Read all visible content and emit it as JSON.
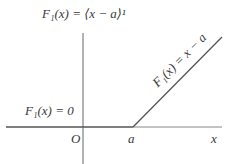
{
  "diagram": {
    "title_label": "F₁(x) = ⟨x − a⟩¹",
    "left_label": "F₁(x) = 0",
    "slope_label": "F₁(x) = x − a",
    "origin_label": "O",
    "a_label": "a",
    "x_axis_label": "x",
    "colors": {
      "line": "#555555",
      "text": "#3a3a3a"
    }
  }
}
